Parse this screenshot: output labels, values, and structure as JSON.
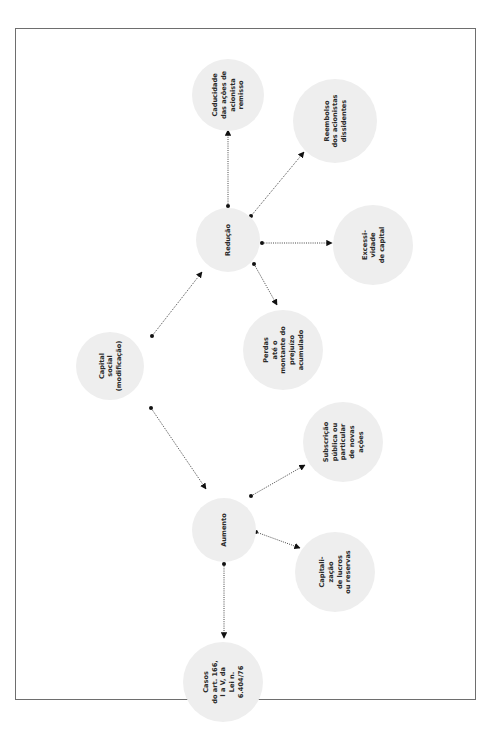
{
  "diagram": {
    "type": "concept-map",
    "orientation": "rotated-90-ccw",
    "colors": {
      "node_fill": "#eeeeee",
      "edge": "#333333",
      "frame": "#6e6e6e",
      "text": "#2a2a2a"
    },
    "nodes": [
      {
        "id": "capital",
        "cx": 110,
        "cy": 366,
        "r": 34,
        "lines": [
          "Capital",
          "social",
          "(modificação)"
        ]
      },
      {
        "id": "reducao",
        "cx": 228,
        "cy": 240,
        "r": 32,
        "lines": [
          "Redução"
        ]
      },
      {
        "id": "aumento",
        "cx": 224,
        "cy": 530,
        "r": 32,
        "lines": [
          "Aumento"
        ]
      },
      {
        "id": "caducidade",
        "cx": 228,
        "cy": 95,
        "r": 36,
        "lines": [
          "Caducidade",
          "das ações de",
          "acionista",
          "remisso"
        ]
      },
      {
        "id": "reembolso",
        "cx": 335,
        "cy": 121,
        "r": 42,
        "lines": [
          "Reembolso",
          "dos acionistas",
          "dissidentes"
        ]
      },
      {
        "id": "excessividade",
        "cx": 373,
        "cy": 245,
        "r": 40,
        "lines": [
          "Excessi-",
          "vidade",
          "de capital"
        ]
      },
      {
        "id": "perdas",
        "cx": 283,
        "cy": 350,
        "r": 40,
        "lines": [
          "Perdas",
          "até o",
          "montante do",
          "prejuízo",
          "acumulado"
        ]
      },
      {
        "id": "subscricao",
        "cx": 343,
        "cy": 442,
        "r": 40,
        "lines": [
          "Subscrição",
          "pública ou",
          "particular",
          "de novas",
          "ações"
        ]
      },
      {
        "id": "capitalizacao",
        "cx": 335,
        "cy": 572,
        "r": 40,
        "lines": [
          "Capitali-",
          "zação",
          "de lucros",
          "ou reservas"
        ]
      },
      {
        "id": "casos",
        "cx": 223,
        "cy": 682,
        "r": 40,
        "lines": [
          "Casos",
          "do art. 166,",
          "I a V, da",
          "Lei n.",
          "6.404/76"
        ]
      }
    ],
    "edges": [
      {
        "from": "capital",
        "to": "reducao",
        "x1": 152,
        "y1": 336,
        "x2": 202,
        "y2": 272
      },
      {
        "from": "capital",
        "to": "aumento",
        "x1": 151,
        "y1": 408,
        "x2": 206,
        "y2": 489
      },
      {
        "from": "reducao",
        "to": "caducidade",
        "x1": 228,
        "y1": 206,
        "x2": 228,
        "y2": 130
      },
      {
        "from": "reducao",
        "to": "reembolso",
        "x1": 251,
        "y1": 216,
        "x2": 304,
        "y2": 152
      },
      {
        "from": "reducao",
        "to": "excessividade",
        "x1": 262,
        "y1": 243,
        "x2": 332,
        "y2": 243
      },
      {
        "from": "reducao",
        "to": "perdas",
        "x1": 254,
        "y1": 264,
        "x2": 277,
        "y2": 305
      },
      {
        "from": "aumento",
        "to": "subscricao",
        "x1": 251,
        "y1": 496,
        "x2": 305,
        "y2": 465
      },
      {
        "from": "aumento",
        "to": "capitalizacao",
        "x1": 256,
        "y1": 532,
        "x2": 300,
        "y2": 548
      },
      {
        "from": "aumento",
        "to": "casos",
        "x1": 224,
        "y1": 564,
        "x2": 224,
        "y2": 638
      }
    ]
  }
}
